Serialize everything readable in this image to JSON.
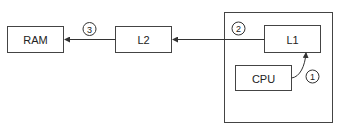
{
  "diagram": {
    "nodes": [
      {
        "id": "ram",
        "label": "RAM"
      },
      {
        "id": "l2",
        "label": "L2"
      },
      {
        "id": "l1",
        "label": "L1"
      },
      {
        "id": "cpu",
        "label": "CPU"
      }
    ],
    "container": {
      "id": "cpu-package",
      "contains": [
        "l1",
        "cpu"
      ]
    },
    "edges": [
      {
        "from": "cpu",
        "to": "l1",
        "step": "1"
      },
      {
        "from": "l1",
        "to": "l2",
        "step": "2"
      },
      {
        "from": "l2",
        "to": "ram",
        "step": "3"
      }
    ],
    "colors": {
      "stroke": "#333333",
      "background": "#ffffff",
      "text": "#222222"
    }
  }
}
